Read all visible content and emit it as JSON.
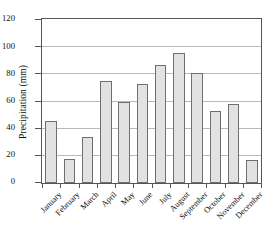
{
  "chart_data": {
    "type": "bar",
    "title": "",
    "xlabel": "",
    "ylabel": "Precipitation (mm)",
    "categories": [
      "January",
      "February",
      "March",
      "April",
      "May",
      "June",
      "July",
      "August",
      "September",
      "October",
      "November",
      "December"
    ],
    "values": [
      46,
      18,
      34,
      75,
      60,
      73,
      87,
      96,
      81,
      53,
      58,
      17
    ],
    "ylim": [
      0,
      120
    ],
    "ytick_labels": [
      "0",
      "20",
      "40",
      "60",
      "80",
      "100",
      "120"
    ],
    "ytick_values": [
      0,
      20,
      40,
      60,
      80,
      100,
      120
    ],
    "grid": true,
    "legend": "none",
    "bar_fill_color": "#e2e2e2",
    "bar_border_color": "#6f6f6f",
    "axis_color": "#555555",
    "gridline_color": "#b8b8b8"
  }
}
